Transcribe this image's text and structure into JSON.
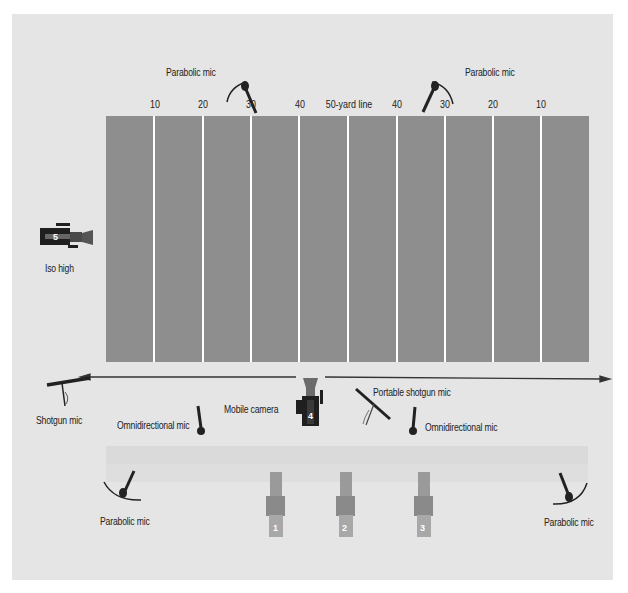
{
  "diagram": {
    "field": {
      "color": "#8e8e8e",
      "yard_lines": [
        "10",
        "20",
        "30",
        "40",
        "50-yard line",
        "40",
        "30",
        "20",
        "10"
      ]
    },
    "arrow": {
      "direction": "both",
      "color": "#333333"
    },
    "labels": {
      "parabolic_top_left": "Parabolic mic",
      "parabolic_top_right": "Parabolic mic",
      "parabolic_bottom_left": "Parabolic mic",
      "parabolic_bottom_right": "Parabolic mic",
      "iso_high": "Iso high",
      "shotgun_mic": "Shotgun mic",
      "omni_left": "Omnidirectional mic",
      "omni_right": "Omnidirectional mic",
      "mobile_camera": "Mobile camera",
      "portable_shotgun": "Portable shotgun mic"
    },
    "cameras": [
      {
        "number": "1",
        "position": "sideline"
      },
      {
        "number": "2",
        "position": "sideline"
      },
      {
        "number": "3",
        "position": "sideline"
      },
      {
        "number": "4",
        "position": "mobile"
      },
      {
        "number": "5",
        "position": "iso high"
      }
    ]
  }
}
